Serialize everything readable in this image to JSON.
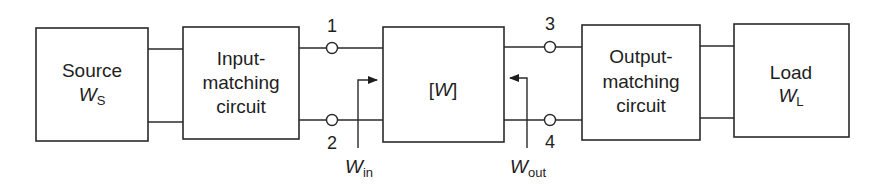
{
  "diagram": {
    "type": "block-diagram",
    "blocks": [
      {
        "id": "source",
        "lines": [
          "Source"
        ],
        "symbol": "W",
        "subscript": "S"
      },
      {
        "id": "input-matching",
        "lines": [
          "Input-",
          "matching",
          "circuit"
        ]
      },
      {
        "id": "network",
        "label_open": "[",
        "symbol": "W",
        "label_close": "]"
      },
      {
        "id": "output-matching",
        "lines": [
          "Output-",
          "matching",
          "circuit"
        ]
      },
      {
        "id": "load",
        "lines": [
          "Load"
        ],
        "symbol": "W",
        "subscript": "L"
      }
    ],
    "ports": [
      "1",
      "2",
      "3",
      "4"
    ],
    "reference_labels": [
      {
        "id": "w-in",
        "symbol": "W",
        "subscript": "in",
        "direction": "into network from input side"
      },
      {
        "id": "w-out",
        "symbol": "W",
        "subscript": "out",
        "direction": "into network from output side"
      }
    ]
  }
}
